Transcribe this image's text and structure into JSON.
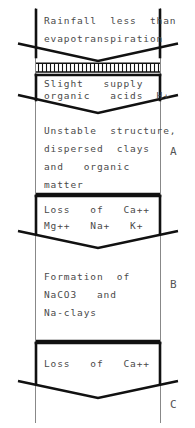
{
  "diagram": {
    "type": "soil-horizon-profile",
    "colors": {
      "ink": "#1a1a1a",
      "text": "#4a4a4a",
      "background": "#ffffff",
      "thin_rule": "#6f6f6f"
    },
    "blocks": [
      {
        "id": "block-rainfall",
        "lines": [
          "Rainfall  less  than",
          "evapotranspiration"
        ]
      },
      {
        "id": "block-hatched",
        "lines": [],
        "pattern": "vertical-hatch-band"
      },
      {
        "id": "block-slight-supply",
        "lines": [
          "Slight   supply",
          "organic   acids  H+"
        ]
      },
      {
        "id": "block-unstable",
        "lines": [
          "Unstable  structure,",
          "dispersed  clays",
          "and   organic",
          "matter"
        ]
      },
      {
        "id": "block-loss-cations",
        "lines": [
          "Loss   of   Ca++",
          "Mg++   Na+   K+"
        ]
      },
      {
        "id": "block-formation",
        "lines": [
          "Formation  of",
          "NaCO3   and",
          "Na-clays"
        ]
      },
      {
        "id": "block-loss-ca",
        "lines": [
          "Loss   of   Ca++"
        ]
      }
    ],
    "horizons": [
      {
        "id": "horizon-a",
        "label": "A"
      },
      {
        "id": "horizon-b",
        "label": "B"
      },
      {
        "id": "horizon-c",
        "label": "C"
      }
    ]
  }
}
